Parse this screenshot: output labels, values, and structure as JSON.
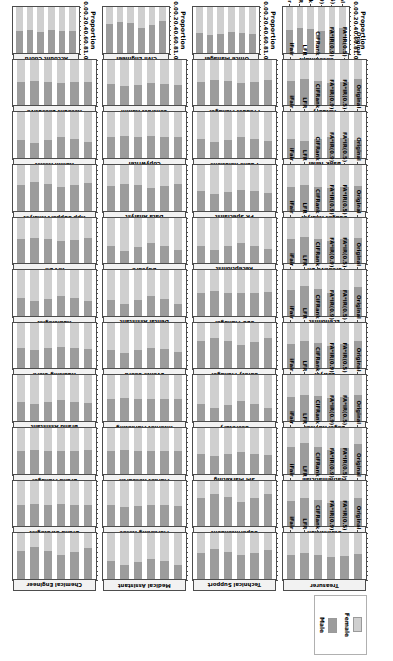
{
  "figure": {
    "axis_title": "Proportion",
    "tick_labels": [
      "0.0",
      "0.2",
      "0.4",
      "0.6",
      "0.8",
      "1.0"
    ],
    "tick_values": [
      0.0,
      0.2,
      0.4,
      0.6,
      0.8,
      1.0
    ],
    "method_labels": [
      "Original",
      "FA*IR(0.5)",
      "FA*IR(0.9)",
      "CIFRank",
      "LFR",
      "iFair"
    ]
  },
  "legend": {
    "items": [
      {
        "label": "Female",
        "color": "#cfcfcf"
      },
      {
        "label": "Male",
        "color": "#9c9c9c"
      }
    ]
  },
  "chart_data": {
    "type": "bar",
    "title": "",
    "xlabel": "Proportion",
    "ylabel": "",
    "xlim": [
      0.0,
      1.0
    ],
    "grid": false,
    "legend_position": "right",
    "orientation": "horizontal-stacked",
    "categories": [
      "Original",
      "FA*IR(0.5)",
      "FA*IR(0.9)",
      "CIFRank",
      "LFR",
      "iFair"
    ],
    "series_names": [
      "Female",
      "Male"
    ],
    "facet_columns": 4,
    "facet_rows": 11,
    "panels": [
      {
        "occupation": "Accountant",
        "female": [
          0.46,
          0.5,
          0.52,
          0.48,
          0.45,
          0.49
        ],
        "male": [
          0.54,
          0.5,
          0.48,
          0.52,
          0.55,
          0.51
        ]
      },
      {
        "occupation": "Office Manager",
        "female": [
          0.58,
          0.55,
          0.53,
          0.57,
          0.6,
          0.56
        ],
        "male": [
          0.42,
          0.45,
          0.47,
          0.43,
          0.4,
          0.44
        ]
      },
      {
        "occupation": "Civil Engineer",
        "female": [
          0.3,
          0.38,
          0.44,
          0.35,
          0.32,
          0.36
        ],
        "male": [
          0.7,
          0.62,
          0.56,
          0.65,
          0.68,
          0.64
        ]
      },
      {
        "occupation": "Account Coord",
        "female": [
          0.52,
          0.51,
          0.5,
          0.53,
          0.49,
          0.52
        ],
        "male": [
          0.48,
          0.49,
          0.5,
          0.47,
          0.51,
          0.48
        ]
      },
      {
        "occupation": "Actuary",
        "female": [
          0.42,
          0.47,
          0.5,
          0.45,
          0.41,
          0.46
        ],
        "male": [
          0.58,
          0.53,
          0.5,
          0.55,
          0.59,
          0.54
        ]
      },
      {
        "occupation": "Product Manager",
        "female": [
          0.44,
          0.48,
          0.51,
          0.46,
          0.43,
          0.47
        ],
        "male": [
          0.56,
          0.52,
          0.49,
          0.54,
          0.57,
          0.53
        ]
      },
      {
        "occupation": "Contract Admin",
        "female": [
          0.55,
          0.53,
          0.51,
          0.54,
          0.57,
          0.52
        ],
        "male": [
          0.45,
          0.47,
          0.49,
          0.46,
          0.43,
          0.48
        ]
      },
      {
        "occupation": "Account Executive",
        "female": [
          0.47,
          0.49,
          0.5,
          0.48,
          0.46,
          0.49
        ],
        "male": [
          0.53,
          0.51,
          0.5,
          0.52,
          0.54,
          0.51
        ]
      },
      {
        "occupation": "Bank Teller",
        "female": [
          0.6,
          0.56,
          0.53,
          0.58,
          0.62,
          0.57
        ],
        "male": [
          0.4,
          0.44,
          0.47,
          0.42,
          0.38,
          0.43
        ]
      },
      {
        "occupation": "Public Relations",
        "female": [
          0.62,
          0.57,
          0.54,
          0.59,
          0.63,
          0.58
        ],
        "male": [
          0.38,
          0.43,
          0.46,
          0.41,
          0.37,
          0.42
        ]
      },
      {
        "occupation": "Copywriter",
        "female": [
          0.53,
          0.52,
          0.51,
          0.54,
          0.5,
          0.52
        ],
        "male": [
          0.47,
          0.48,
          0.49,
          0.46,
          0.5,
          0.48
        ]
      },
      {
        "occupation": "Admin Assist",
        "female": [
          0.64,
          0.58,
          0.54,
          0.6,
          0.65,
          0.59
        ],
        "male": [
          0.36,
          0.42,
          0.46,
          0.4,
          0.35,
          0.41
        ]
      },
      {
        "occupation": "Budget Analyst",
        "female": [
          0.45,
          0.48,
          0.5,
          0.47,
          0.44,
          0.48
        ],
        "male": [
          0.55,
          0.52,
          0.5,
          0.53,
          0.56,
          0.52
        ]
      },
      {
        "occupation": "PR Specialist",
        "female": [
          0.61,
          0.56,
          0.53,
          0.58,
          0.62,
          0.57
        ],
        "male": [
          0.39,
          0.44,
          0.47,
          0.42,
          0.38,
          0.43
        ]
      },
      {
        "occupation": "Data Analyst",
        "female": [
          0.41,
          0.46,
          0.49,
          0.44,
          0.4,
          0.45
        ],
        "male": [
          0.59,
          0.54,
          0.51,
          0.56,
          0.6,
          0.55
        ]
      },
      {
        "occupation": "App Support Analyst",
        "female": [
          0.38,
          0.44,
          0.48,
          0.42,
          0.37,
          0.43
        ],
        "male": [
          0.62,
          0.56,
          0.52,
          0.58,
          0.63,
          0.57
        ]
      },
      {
        "occupation": "Creative Dir",
        "female": [
          0.43,
          0.47,
          0.5,
          0.46,
          0.42,
          0.47
        ],
        "male": [
          0.57,
          0.53,
          0.5,
          0.54,
          0.58,
          0.53
        ]
      },
      {
        "occupation": "Receptionist",
        "female": [
          0.68,
          0.6,
          0.55,
          0.62,
          0.69,
          0.61
        ],
        "male": [
          0.32,
          0.4,
          0.45,
          0.38,
          0.31,
          0.39
        ]
      },
      {
        "occupation": "Daycare",
        "female": [
          0.7,
          0.61,
          0.55,
          0.63,
          0.71,
          0.62
        ],
        "male": [
          0.3,
          0.39,
          0.45,
          0.37,
          0.29,
          0.38
        ]
      },
      {
        "occupation": "Art Dir",
        "female": [
          0.44,
          0.48,
          0.5,
          0.47,
          0.43,
          0.47
        ],
        "male": [
          0.56,
          0.52,
          0.5,
          0.53,
          0.57,
          0.53
        ]
      },
      {
        "occupation": "Economist",
        "female": [
          0.36,
          0.43,
          0.48,
          0.41,
          0.35,
          0.42
        ],
        "male": [
          0.64,
          0.57,
          0.52,
          0.59,
          0.65,
          0.58
        ]
      },
      {
        "occupation": "SEO Manager",
        "female": [
          0.46,
          0.49,
          0.5,
          0.48,
          0.45,
          0.48
        ],
        "male": [
          0.54,
          0.51,
          0.5,
          0.52,
          0.55,
          0.52
        ]
      },
      {
        "occupation": "Dental Assistant",
        "female": [
          0.72,
          0.62,
          0.56,
          0.64,
          0.73,
          0.63
        ],
        "male": [
          0.28,
          0.38,
          0.44,
          0.36,
          0.27,
          0.37
        ]
      },
      {
        "occupation": "Audiologist",
        "female": [
          0.66,
          0.59,
          0.55,
          0.61,
          0.67,
          0.6
        ],
        "male": [
          0.34,
          0.41,
          0.45,
          0.39,
          0.33,
          0.4
        ]
      },
      {
        "occupation": "Lawyer",
        "female": [
          0.4,
          0.46,
          0.49,
          0.44,
          0.39,
          0.45
        ],
        "male": [
          0.6,
          0.54,
          0.51,
          0.56,
          0.61,
          0.55
        ]
      },
      {
        "occupation": "Safety Manager",
        "female": [
          0.33,
          0.41,
          0.47,
          0.39,
          0.32,
          0.4
        ],
        "male": [
          0.67,
          0.59,
          0.53,
          0.61,
          0.68,
          0.6
        ]
      },
      {
        "occupation": "Events Coord",
        "female": [
          0.63,
          0.57,
          0.54,
          0.59,
          0.64,
          0.58
        ],
        "male": [
          0.37,
          0.43,
          0.46,
          0.41,
          0.36,
          0.42
        ]
      },
      {
        "occupation": "Auditing Clerk",
        "female": [
          0.56,
          0.54,
          0.52,
          0.55,
          0.58,
          0.54
        ],
        "male": [
          0.44,
          0.46,
          0.48,
          0.45,
          0.42,
          0.46
        ]
      },
      {
        "occupation": "Legal Advisor",
        "female": [
          0.42,
          0.47,
          0.49,
          0.45,
          0.41,
          0.46
        ],
        "male": [
          0.58,
          0.53,
          0.51,
          0.55,
          0.59,
          0.54
        ]
      },
      {
        "occupation": "Secretary",
        "female": [
          0.69,
          0.61,
          0.55,
          0.63,
          0.7,
          0.62
        ],
        "male": [
          0.31,
          0.39,
          0.45,
          0.37,
          0.3,
          0.38
        ]
      },
      {
        "occupation": "Internet Marketing",
        "female": [
          0.5,
          0.5,
          0.5,
          0.51,
          0.49,
          0.5
        ],
        "male": [
          0.5,
          0.5,
          0.5,
          0.49,
          0.51,
          0.5
        ]
      },
      {
        "occupation": "Brand Assistant",
        "female": [
          0.59,
          0.56,
          0.53,
          0.57,
          0.61,
          0.56
        ],
        "male": [
          0.41,
          0.44,
          0.47,
          0.43,
          0.39,
          0.44
        ]
      },
      {
        "occupation": "Mathematician",
        "female": [
          0.34,
          0.42,
          0.47,
          0.4,
          0.33,
          0.41
        ],
        "male": [
          0.66,
          0.58,
          0.53,
          0.6,
          0.67,
          0.59
        ]
      },
      {
        "occupation": "SM Marketing",
        "female": [
          0.57,
          0.55,
          0.52,
          0.56,
          0.59,
          0.55
        ],
        "male": [
          0.43,
          0.45,
          0.48,
          0.44,
          0.41,
          0.45
        ]
      },
      {
        "occupation": "Market Research",
        "female": [
          0.49,
          0.5,
          0.5,
          0.5,
          0.48,
          0.5
        ],
        "male": [
          0.51,
          0.5,
          0.5,
          0.5,
          0.52,
          0.5
        ]
      },
      {
        "occupation": "Brand Manager",
        "female": [
          0.48,
          0.49,
          0.5,
          0.49,
          0.47,
          0.49
        ],
        "male": [
          0.52,
          0.51,
          0.5,
          0.51,
          0.53,
          0.51
        ]
      },
      {
        "occupation": "Statistician",
        "female": [
          0.37,
          0.44,
          0.48,
          0.42,
          0.36,
          0.43
        ],
        "male": [
          0.63,
          0.56,
          0.52,
          0.58,
          0.64,
          0.57
        ]
      },
      {
        "occupation": "Superintendent",
        "female": [
          0.29,
          0.38,
          0.45,
          0.35,
          0.28,
          0.36
        ],
        "male": [
          0.71,
          0.62,
          0.55,
          0.65,
          0.72,
          0.64
        ]
      },
      {
        "occupation": "Marketing Assoc",
        "female": [
          0.54,
          0.53,
          0.51,
          0.54,
          0.56,
          0.53
        ],
        "male": [
          0.46,
          0.47,
          0.49,
          0.46,
          0.44,
          0.47
        ]
      },
      {
        "occupation": "Brand Strategist",
        "female": [
          0.51,
          0.51,
          0.5,
          0.52,
          0.5,
          0.51
        ],
        "male": [
          0.49,
          0.49,
          0.5,
          0.48,
          0.5,
          0.49
        ]
      },
      {
        "occupation": "Treasurer",
        "female": [
          0.44,
          0.48,
          0.5,
          0.46,
          0.43,
          0.47
        ],
        "male": [
          0.56,
          0.52,
          0.5,
          0.54,
          0.57,
          0.53
        ]
      },
      {
        "occupation": "Technical Support",
        "female": [
          0.35,
          0.43,
          0.47,
          0.41,
          0.34,
          0.42
        ],
        "male": [
          0.65,
          0.57,
          0.53,
          0.59,
          0.66,
          0.58
        ]
      },
      {
        "occupation": "Medical Assistant",
        "female": [
          0.67,
          0.59,
          0.55,
          0.61,
          0.68,
          0.6
        ],
        "male": [
          0.33,
          0.41,
          0.45,
          0.39,
          0.32,
          0.4
        ]
      },
      {
        "occupation": "Chemical Engineer",
        "female": [
          0.31,
          0.4,
          0.46,
          0.37,
          0.3,
          0.38
        ],
        "male": [
          0.69,
          0.6,
          0.54,
          0.63,
          0.7,
          0.62
        ]
      }
    ]
  }
}
